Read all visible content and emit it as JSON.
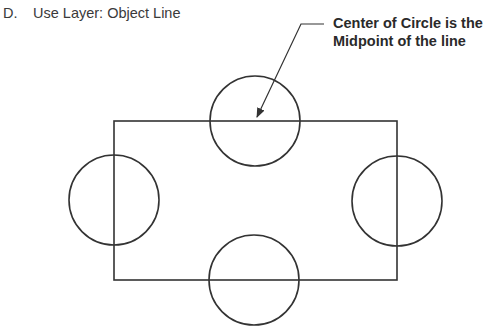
{
  "instruction": {
    "letter": "D.",
    "text": "Use Layer: Object Line"
  },
  "callout": {
    "line1": "Center of Circle is the",
    "line2": "Midpoint of the line"
  },
  "drawing": {
    "stroke_color": "#333333",
    "rectangle": {
      "x1": 114,
      "y1": 121,
      "x2": 397,
      "y2": 280
    },
    "circles": [
      {
        "name": "top",
        "cx": 255,
        "cy": 121,
        "r": 45
      },
      {
        "name": "left",
        "cx": 114,
        "cy": 200,
        "r": 45
      },
      {
        "name": "right",
        "cx": 397,
        "cy": 201,
        "r": 45
      },
      {
        "name": "bottom",
        "cx": 254,
        "cy": 280,
        "r": 45
      }
    ],
    "leader": {
      "start": [
        324,
        24
      ],
      "elbow": [
        301,
        24
      ],
      "tip": [
        257,
        117
      ]
    }
  }
}
